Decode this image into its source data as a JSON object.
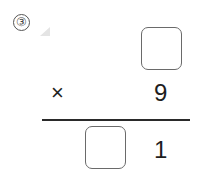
{
  "problem": {
    "number_label": "③",
    "operator": "×",
    "multiplicand": {
      "blank": true,
      "value": ""
    },
    "multiplier": "9",
    "product": {
      "tens_blank": true,
      "tens_value": "",
      "ones_digit": "1"
    }
  }
}
